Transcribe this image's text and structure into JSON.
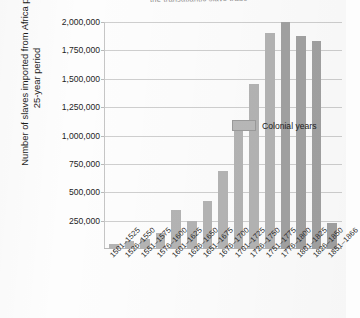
{
  "chart_data": {
    "type": "bar",
    "title": "the transatlantic slave trade",
    "xlabel": "",
    "ylabel": "Number of slaves imported from Africa per 25-year period",
    "ylim": [
      0,
      2000000
    ],
    "ytick_labels": [
      "2,000,000",
      "1,750,000",
      "1,500,000",
      "1,250,000",
      "1,000,000",
      "750,000",
      "500,000",
      "250,000"
    ],
    "ytick_values": [
      2000000,
      1750000,
      1500000,
      1250000,
      1000000,
      750000,
      500000,
      250000
    ],
    "grid": true,
    "legend": {
      "position": "inside-upper-left",
      "entries": [
        {
          "label": "Colonial years",
          "color": "#b9b9b9"
        }
      ]
    },
    "categories": [
      "1501–1525",
      "1526–1550",
      "1551–1575",
      "1576–1600",
      "1601–1625",
      "1626–1650",
      "1651–1675",
      "1676–1700",
      "1701–1725",
      "1726–1750",
      "1751–1775",
      "1776–1800",
      "1801–1825",
      "1826–1850",
      "1851–1866"
    ],
    "values": [
      40000,
      75000,
      90000,
      140000,
      340000,
      250000,
      420000,
      690000,
      1080000,
      1450000,
      1900000,
      2000000,
      1880000,
      1830000,
      230000
    ],
    "bar_colors": [
      "#b4b4b4",
      "#b4b4b4",
      "#b4b4b4",
      "#b4b4b4",
      "#b4b4b4",
      "#b4b4b4",
      "#b4b4b4",
      "#b4b4b4",
      "#b4b4b4",
      "#b4b4b4",
      "#b4b4b4",
      "#a2a2a2",
      "#a2a2a2",
      "#a2a2a2",
      "#a2a2a2"
    ]
  }
}
